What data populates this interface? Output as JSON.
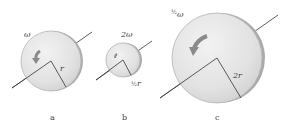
{
  "figure": {
    "panels": [
      {
        "id": "a",
        "caption": "a",
        "omega_label": "ω",
        "radius_label": "r"
      },
      {
        "id": "b",
        "caption": "b",
        "omega_label": "2ω",
        "radius_label": "r",
        "radius_fraction": "½"
      },
      {
        "id": "c",
        "caption": "c",
        "omega_label": "ω",
        "omega_fraction": "½",
        "radius_label": "2r"
      }
    ]
  },
  "colors": {
    "disk_face": "#e4e4e4",
    "disk_edge": "#b9b9b9",
    "disk_rim": "#9a9a9a",
    "line": "#333333",
    "arrow": "#8a8a8a"
  }
}
